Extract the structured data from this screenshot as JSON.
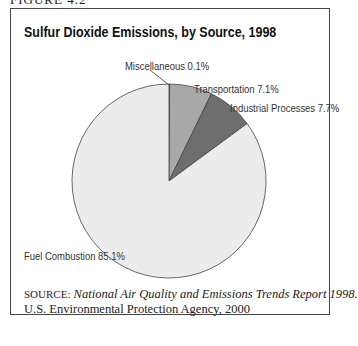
{
  "figure_label": "FIGURE 4.2",
  "chart_data": {
    "type": "pie",
    "title": "Sulfur Dioxide Emissions, by Source, 1998",
    "categories": [
      "Fuel Combustion",
      "Industrial Processes",
      "Transportation",
      "Miscellaneous"
    ],
    "values": [
      85.1,
      7.7,
      7.1,
      0.1
    ],
    "unit": "%",
    "colors": [
      "#ececec",
      "#6e6e6e",
      "#a8a8a8",
      "#cfcfcf"
    ],
    "labels": {
      "fuel": "Fuel Combustion 85.1%",
      "industrial": "Industrial Processes 7.7%",
      "transportation": "Transportation 7.1%",
      "misc": "Miscellaneous 0.1%"
    },
    "legend": "none (direct labels)"
  },
  "source": {
    "prefix": "SOURCE:",
    "title": "National Air Quality and Emissions Trends Report 1998.",
    "publisher": "U.S. Environmental Protection Agency, 2000"
  }
}
